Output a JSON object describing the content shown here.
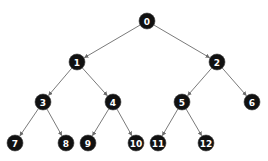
{
  "diagram": {
    "type": "binary-tree",
    "colors": {
      "node_fill": "#111111",
      "node_text": "#ffffff",
      "edge": "#6b6b6b",
      "background": "#ffffff"
    },
    "nodes": [
      {
        "id": "0",
        "label": "0",
        "x": 147,
        "y": 21
      },
      {
        "id": "1",
        "label": "1",
        "x": 77,
        "y": 62
      },
      {
        "id": "2",
        "label": "2",
        "x": 217,
        "y": 62
      },
      {
        "id": "3",
        "label": "3",
        "x": 43,
        "y": 102
      },
      {
        "id": "4",
        "label": "4",
        "x": 113,
        "y": 102
      },
      {
        "id": "5",
        "label": "5",
        "x": 182,
        "y": 102
      },
      {
        "id": "6",
        "label": "6",
        "x": 252,
        "y": 102
      },
      {
        "id": "7",
        "label": "7",
        "x": 15,
        "y": 143
      },
      {
        "id": "8",
        "label": "8",
        "x": 66,
        "y": 143
      },
      {
        "id": "9",
        "label": "9",
        "x": 88,
        "y": 143
      },
      {
        "id": "10",
        "label": "10",
        "x": 136,
        "y": 143
      },
      {
        "id": "11",
        "label": "11",
        "x": 158,
        "y": 143
      },
      {
        "id": "12",
        "label": "12",
        "x": 206,
        "y": 143
      }
    ],
    "edges": [
      {
        "from": "0",
        "to": "1"
      },
      {
        "from": "0",
        "to": "2"
      },
      {
        "from": "1",
        "to": "3"
      },
      {
        "from": "1",
        "to": "4"
      },
      {
        "from": "2",
        "to": "5"
      },
      {
        "from": "2",
        "to": "6"
      },
      {
        "from": "3",
        "to": "7"
      },
      {
        "from": "3",
        "to": "8"
      },
      {
        "from": "4",
        "to": "9"
      },
      {
        "from": "4",
        "to": "10"
      },
      {
        "from": "5",
        "to": "11"
      },
      {
        "from": "5",
        "to": "12"
      }
    ]
  }
}
